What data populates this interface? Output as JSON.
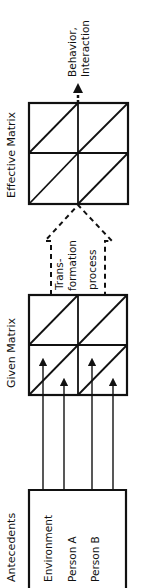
{
  "diagram": {
    "column_labels": {
      "antecedents": "Antecedents",
      "given_matrix": "Given Matrix",
      "effective_matrix": "Effective Matrix"
    },
    "antecedents": [
      "Environment",
      "Person A",
      "Person B"
    ],
    "transformation": [
      "Trans-",
      "formation",
      "process"
    ],
    "output": [
      "Behavior,",
      "Interaction"
    ],
    "orientation": "rotated -90deg (reads bottom-to-top)",
    "colors": {
      "ink": "#111111",
      "background": "#ffffff"
    }
  }
}
